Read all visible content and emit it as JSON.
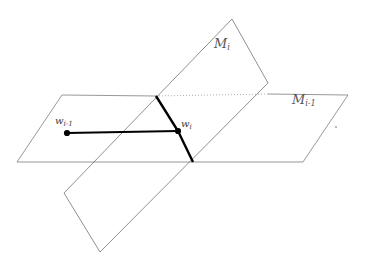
{
  "figure": {
    "background_color": "#ffffff",
    "width": 365,
    "height": 270,
    "labels": {
      "manifold_i": {
        "symbol": "M",
        "subscript": "i",
        "text": "M_i",
        "color": "#555555"
      },
      "manifold_i_minus_1": {
        "symbol": "M",
        "subscript": "i-1",
        "text": "M_{i-1}",
        "color": "#555555"
      },
      "point_w_i_minus_1": {
        "symbol": "w",
        "subscript": "i-1",
        "text": "w_{i-1}",
        "color": "#3a3a3a"
      },
      "point_w_i": {
        "symbol": "w",
        "subscript": "i",
        "text": "w_i",
        "color": "#3a3a3a"
      }
    },
    "shapes": {
      "plane_horizontal": {
        "name": "M_{i-1} plane",
        "points": "62,95 348,95 303,162 17,162",
        "stroke": "#6b6b6b",
        "stroke_width": 0.7,
        "fill": "none"
      },
      "plane_tilted": {
        "name": "M_i plane",
        "points": "232,19 268,83 100,252 64,193",
        "stroke": "#6b6b6b",
        "stroke_width": 0.7,
        "fill": "none"
      },
      "intersection_dotted": {
        "name": "hidden intersection edge",
        "from": [
          156,
          96
        ],
        "to": [
          268,
          94
        ],
        "stroke": "#8d8d8d",
        "dash": "1,2"
      },
      "path_vertical": {
        "name": "geodesic segment on M_i",
        "points": "156,96 178,131 193,162",
        "stroke": "#000000",
        "stroke_width": 2.4
      },
      "path_horizontal": {
        "name": "geodesic segment on M_{i-1}",
        "from": [
          67,
          133
        ],
        "to": [
          178,
          131
        ],
        "stroke": "#000000",
        "stroke_width": 2.2
      },
      "dot_w_i_minus_1": {
        "cx": 67,
        "cy": 133,
        "r": 3.1,
        "fill": "#000000"
      },
      "dot_w_i": {
        "cx": 178,
        "cy": 131,
        "r": 3.1,
        "fill": "#000000"
      },
      "speck": {
        "cx": 336,
        "cy": 127,
        "r": 0.9,
        "fill": "#9a9a9a"
      }
    }
  }
}
